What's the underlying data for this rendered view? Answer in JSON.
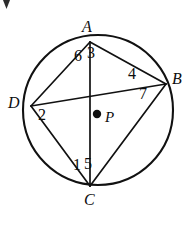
{
  "figure": {
    "type": "circle-geometry-diagram",
    "canvas": {
      "width": 194,
      "height": 225,
      "background": "#ffffff"
    },
    "stroke_color": "#111111",
    "circle": {
      "center_label": "P",
      "center_x": 98,
      "center_y": 110,
      "radius": 75,
      "stroke_width": 2.0
    },
    "vertices": [
      {
        "id": "A",
        "label": "A",
        "x": 90,
        "y": 42,
        "label_x": 82,
        "label_y": 19
      },
      {
        "id": "B",
        "label": "B",
        "x": 166,
        "y": 84,
        "label_x": 172,
        "label_y": 71
      },
      {
        "id": "C",
        "label": "C",
        "x": 90,
        "y": 186,
        "label_x": 84,
        "label_y": 192
      },
      {
        "id": "D",
        "label": "D",
        "x": 31,
        "y": 106,
        "label_x": 8,
        "label_y": 95
      }
    ],
    "center_point": {
      "label": "P",
      "dot_x": 97,
      "dot_y": 114,
      "dot_radius": 4,
      "label_x": 105,
      "label_y": 110
    },
    "chords": [
      {
        "id": "AB",
        "from": "A",
        "to": "B",
        "kind": "side"
      },
      {
        "id": "BC",
        "from": "B",
        "to": "C",
        "kind": "side"
      },
      {
        "id": "CD",
        "from": "C",
        "to": "D",
        "kind": "side"
      },
      {
        "id": "DA",
        "from": "D",
        "to": "A",
        "kind": "side"
      },
      {
        "id": "AC",
        "from": "A",
        "to": "C",
        "kind": "diagonal"
      },
      {
        "id": "DB",
        "from": "D",
        "to": "B",
        "kind": "diagonal"
      }
    ],
    "angle_labels": [
      {
        "id": "angle-6",
        "text": "6",
        "at_vertex": "A",
        "x": 74,
        "y": 48
      },
      {
        "id": "angle-3",
        "text": "3",
        "at_vertex": "A",
        "x": 87,
        "y": 45
      },
      {
        "id": "angle-4",
        "text": "4",
        "at_vertex": "B",
        "x": 128,
        "y": 66
      },
      {
        "id": "angle-7",
        "text": "7",
        "at_vertex": "B",
        "x": 139,
        "y": 86
      },
      {
        "id": "angle-2",
        "text": "2",
        "at_vertex": "D",
        "x": 38,
        "y": 107
      },
      {
        "id": "angle-1",
        "text": "1",
        "at_vertex": "C",
        "x": 73,
        "y": 157
      },
      {
        "id": "angle-5",
        "text": "5",
        "at_vertex": "C",
        "x": 84,
        "y": 156
      }
    ]
  }
}
